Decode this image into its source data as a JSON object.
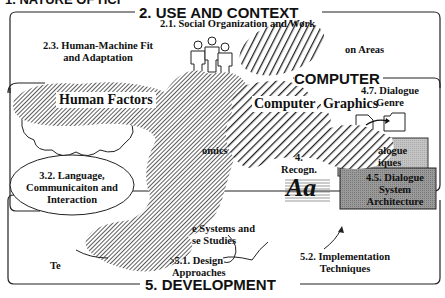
{
  "title_fragment": "1. NATURE OF HCI",
  "sections": {
    "use_and_context": {
      "header": "2. USE AND CONTEXT",
      "items": [
        {
          "id": "2.1",
          "label": "2.1. Social Organization and Work"
        },
        {
          "id": "2.3",
          "label_line1": "2.3. Human-Machine Fit",
          "label_line2": "and Adaptation"
        },
        {
          "id": "2.2",
          "label_partial": "on Areas"
        }
      ]
    },
    "computer": {
      "header": "4. COMPUTER",
      "header_visible": "COMPUTER",
      "items": [
        {
          "id": "4.7",
          "label_line1": "4.7. Dialogue",
          "label_line2": "Genre"
        },
        {
          "id": "4.6",
          "label_line1": "alogue",
          "label_line2": "iques"
        },
        {
          "id": "4.5",
          "label_line1": "4.5. Dialogue",
          "label_line2": "System",
          "label_line3": "Architecture"
        },
        {
          "id": "4.x",
          "label_line1": "4.",
          "label_line2": "Recogn."
        }
      ],
      "recognition_glyph": "Aa"
    },
    "human": {
      "items": [
        {
          "id": "3.2",
          "label_line1": "3.2. Language,",
          "label_line2": "Communicaiton and",
          "label_line3": "Interaction"
        },
        {
          "id": "3.x",
          "label_partial": "omics"
        }
      ]
    },
    "development": {
      "header": "5. DEVELOPMENT",
      "items": [
        {
          "id": "5.1",
          "label_line1": "5.1. Design",
          "label_line2": "Approaches"
        },
        {
          "id": "5.2",
          "label_line1": "5.2. Implementation",
          "label_line2": "Techniques"
        },
        {
          "id": "5.3",
          "label_line1": "e Systems and",
          "label_line2": "se Studies"
        },
        {
          "id": "5.x",
          "label_partial": "Te"
        }
      ]
    }
  },
  "overlays": {
    "human_factors": "Human Factors",
    "computer_graphics_line1": "Computer",
    "computer_graphics_line2": "Graphics"
  },
  "colors": {
    "line": "#222222",
    "box_4_6": "#c8c8c8",
    "box_4_5": "#9a9a9a",
    "hatch_dark": "#333333"
  }
}
